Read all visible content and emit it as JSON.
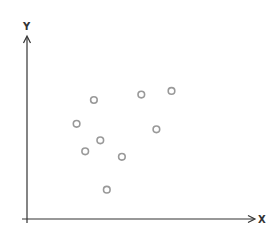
{
  "chart_data": {
    "type": "scatter",
    "title": "",
    "xlabel": "X",
    "ylabel": "Y",
    "xlim": [
      0,
      10
    ],
    "ylim": [
      0,
      10
    ],
    "grid": false,
    "legend": null,
    "ticks": {
      "x": [],
      "y": []
    },
    "series": [
      {
        "name": "points",
        "marker": "open-circle",
        "color": "#999999",
        "points": [
          {
            "x": 3.1,
            "y": 6.5
          },
          {
            "x": 5.3,
            "y": 6.8
          },
          {
            "x": 6.7,
            "y": 7.0
          },
          {
            "x": 2.3,
            "y": 5.2
          },
          {
            "x": 6.0,
            "y": 4.9
          },
          {
            "x": 3.4,
            "y": 4.3
          },
          {
            "x": 2.7,
            "y": 3.7
          },
          {
            "x": 4.4,
            "y": 3.4
          },
          {
            "x": 3.7,
            "y": 1.6
          }
        ]
      }
    ]
  },
  "axes": {
    "x_label": "X",
    "y_label": "Y",
    "color": "#333333"
  }
}
